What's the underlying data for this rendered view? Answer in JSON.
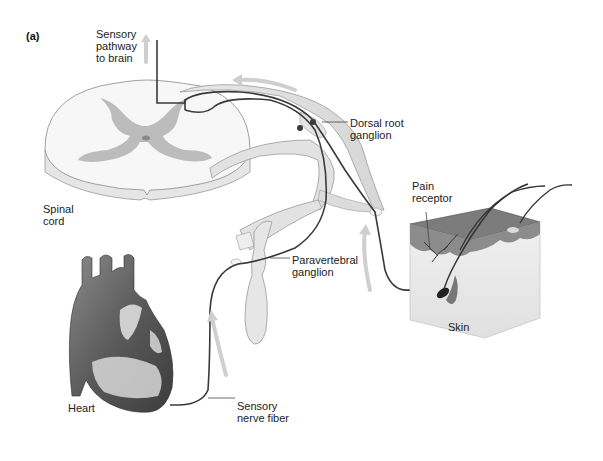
{
  "figure": {
    "panel_label": "(a)",
    "labels": {
      "sensory_pathway": "Sensory\npathway\nto brain",
      "spinal_cord": "Spinal\ncord",
      "dorsal_root_ganglion": "Dorsal root\nganglion",
      "pain_receptor": "Pain\nreceptor",
      "paravertebral_ganglion": "Paravertebral\nganglion",
      "skin": "Skin",
      "heart": "Heart",
      "sensory_nerve_fiber": "Sensory\nnerve fiber"
    },
    "colors": {
      "background": "#ffffff",
      "cord_white_matter": "#f4f4f4",
      "cord_gray_matter": "#b8b8b8",
      "nerve_body": "#e2e2e2",
      "nerve_fiber": "#3a3a3a",
      "arrow": "#cfcfcf",
      "skin_top": "#7a7a7a",
      "heart": "#6e6e6e"
    }
  }
}
